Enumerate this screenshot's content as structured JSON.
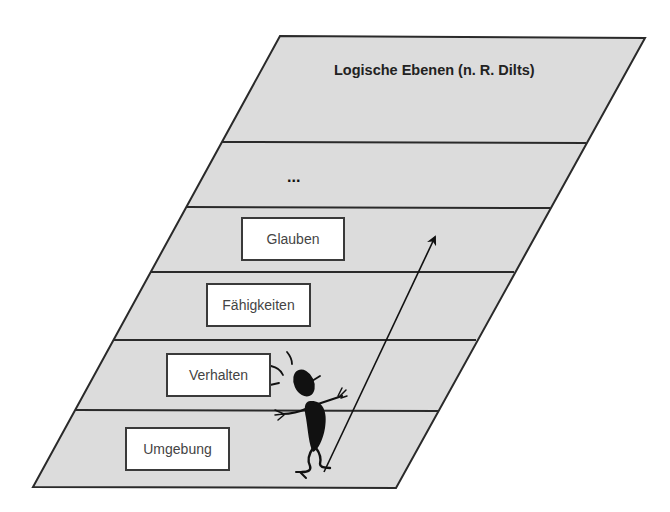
{
  "diagram": {
    "title": "Logische Ebenen (n. R. Dilts)",
    "colors": {
      "plane_fill": "#dcdcdc",
      "stroke": "#2a2a2a",
      "box_fill": "#ffffff",
      "figure": "#111111"
    },
    "levels": [
      {
        "id": "top",
        "label": ""
      },
      {
        "id": "ellipsis",
        "label": "..."
      },
      {
        "id": "glauben",
        "label": "Glauben"
      },
      {
        "id": "faehigkeiten",
        "label": "Fähigkeiten"
      },
      {
        "id": "verhalten",
        "label": "Verhalten"
      },
      {
        "id": "umgebung",
        "label": "Umgebung"
      }
    ],
    "arrow": {
      "direction": "upward",
      "meaning": "progression-through-levels"
    },
    "figure": {
      "description": "cartoon-person-climbing"
    }
  }
}
